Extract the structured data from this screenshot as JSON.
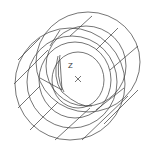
{
  "drawing": {
    "type": "wireframe-3d",
    "subject": "hollow cylinder / bushing",
    "stroke_color": "#3a3a3a",
    "background": "#ffffff",
    "ucs": {
      "axis_label": "Z",
      "origin_marker": "x"
    }
  }
}
